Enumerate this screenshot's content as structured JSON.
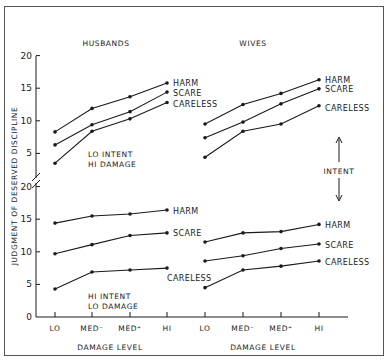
{
  "chart_data": {
    "type": "line",
    "ylabel": "JUDGMENT OF DESERVED DISCIPLINE",
    "xlabel": "DAMAGE LEVEL",
    "categories": [
      "LO",
      "MED⁻",
      "MED⁺",
      "HI"
    ],
    "ylim": [
      0,
      20
    ],
    "yticks": [
      0,
      5,
      10,
      15,
      20
    ],
    "grid": false,
    "legend_position": "inline-right-of-lines",
    "annotations": {
      "upper_condition": "LO INTENT\nHI DAMAGE",
      "lower_condition": "HI INTENT\nLO DAMAGE",
      "intent_arrow": "INTENT"
    },
    "panels": [
      {
        "title": "HUSBANDS",
        "condition": "LO INTENT / HI DAMAGE",
        "row": "upper",
        "series": [
          {
            "name": "HARM",
            "values": [
              8.3,
              11.9,
              13.7,
              15.8
            ]
          },
          {
            "name": "SCARE",
            "values": [
              6.3,
              9.4,
              11.4,
              14.4
            ]
          },
          {
            "name": "CARELESS",
            "values": [
              3.5,
              8.4,
              10.3,
              12.8
            ]
          }
        ]
      },
      {
        "title": "WIVES",
        "condition": "LO INTENT / HI DAMAGE",
        "row": "upper",
        "series": [
          {
            "name": "HARM",
            "values": [
              9.5,
              12.5,
              14.2,
              16.3
            ]
          },
          {
            "name": "SCARE",
            "values": [
              7.4,
              9.8,
              12.6,
              14.9
            ]
          },
          {
            "name": "CARELESS",
            "values": [
              4.4,
              8.4,
              9.5,
              12.3
            ]
          }
        ]
      },
      {
        "title": "HUSBANDS",
        "condition": "HI INTENT / LO DAMAGE",
        "row": "lower",
        "series": [
          {
            "name": "HARM",
            "values": [
              14.4,
              15.5,
              15.8,
              16.4
            ]
          },
          {
            "name": "SCARE",
            "values": [
              9.7,
              11.1,
              12.5,
              12.9
            ]
          },
          {
            "name": "CARELESS",
            "values": [
              4.3,
              6.9,
              7.2,
              7.5
            ]
          }
        ]
      },
      {
        "title": "WIVES",
        "condition": "HI INTENT / LO DAMAGE",
        "row": "lower",
        "series": [
          {
            "name": "HARM",
            "values": [
              11.5,
              12.9,
              13.1,
              14.2
            ]
          },
          {
            "name": "SCARE",
            "values": [
              8.6,
              9.4,
              10.5,
              11.2
            ]
          },
          {
            "name": "CARELESS",
            "values": [
              4.5,
              7.2,
              7.8,
              8.6
            ]
          }
        ]
      }
    ]
  },
  "labels": {
    "husbands": "HUSBANDS",
    "wives": "WIVES",
    "ylabel": "JUDGMENT OF DESERVED DISCIPLINE",
    "xlabel_left": "DAMAGE LEVEL",
    "xlabel_right": "DAMAGE LEVEL",
    "lo_intent": "LO INTENT",
    "hi_damage": "HI DAMAGE",
    "hi_intent": "HI INTENT",
    "lo_damage": "LO DAMAGE",
    "intent": "INTENT",
    "x_ticks": [
      "LO",
      "MED⁻",
      "MED⁺",
      "HI"
    ],
    "y_ticks_upper": [
      "20",
      "15",
      "10",
      "5"
    ],
    "y_ticks_lower": [
      "20",
      "15",
      "10",
      "5",
      "0"
    ]
  },
  "colors": {
    "line": "#1a1a1a",
    "frame": "#555555",
    "background": "#ffffff"
  }
}
